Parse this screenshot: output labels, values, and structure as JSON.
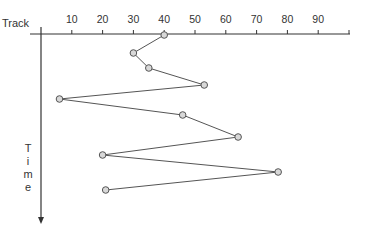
{
  "chart_data": {
    "type": "line",
    "title": "",
    "xlabel": "Track",
    "ylabel": "Time",
    "x_ticks": [
      10,
      20,
      30,
      40,
      50,
      60,
      70,
      80,
      90
    ],
    "xlim": [
      0,
      100
    ],
    "orientation": "x horizontal at top, time flows downward",
    "series": [
      {
        "name": "head movement",
        "sequence_index": [
          1,
          2,
          3,
          4,
          5,
          6,
          7,
          8,
          9,
          10
        ],
        "track": [
          40,
          30,
          35,
          53,
          6,
          46,
          64,
          20,
          77,
          21
        ]
      }
    ],
    "grid": false,
    "legend": null
  },
  "labels": {
    "track": "Track",
    "time": "Time"
  },
  "colors": {
    "axis": "#333333",
    "line": "#555555",
    "marker_fill": "#d8d8d8",
    "marker_stroke": "#555555"
  }
}
